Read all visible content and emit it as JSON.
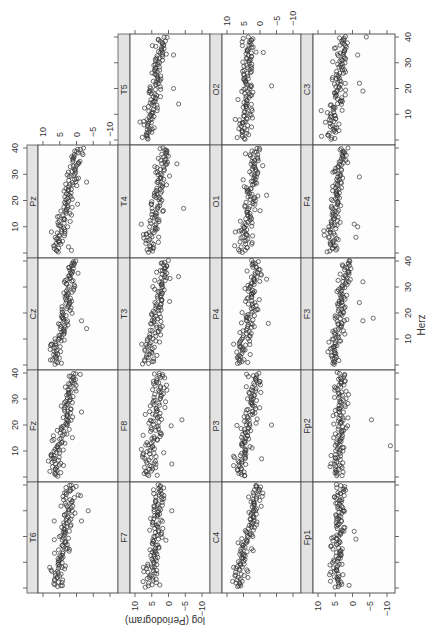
{
  "chart_data": {
    "type": "scatter",
    "title": "",
    "xlabel": "Herz",
    "ylabel": "log (Periodogram)",
    "xlim": [
      0,
      40
    ],
    "ylim": [
      -10,
      10
    ],
    "x_ticks": [
      10,
      20,
      30,
      40
    ],
    "y_ticks": [
      10,
      5,
      0,
      -5,
      -10
    ],
    "y_tick_labels": [
      "10",
      "5",
      "0",
      "−5",
      "−10"
    ],
    "x_tick_labels": [
      "10",
      "20",
      "30",
      "40"
    ],
    "grid": false,
    "legend": null,
    "layout": "trellis multi-panel (lattice xyplot), figure rotated 90° clockwise",
    "panels": [
      {
        "name": "T5",
        "row": 0,
        "col": 1,
        "intercept": 6.5,
        "slope": -0.12,
        "spread": 1.3,
        "outliers": [
          [
            14,
            -3
          ],
          [
            20,
            -1.5
          ],
          [
            33,
            -1.5
          ],
          [
            7,
            8.5
          ]
        ]
      },
      {
        "name": "O2",
        "row": 0,
        "col": 2,
        "intercept": 4.5,
        "slope": -0.03,
        "spread": 1.3,
        "outliers": [
          [
            21,
            -3.5
          ],
          [
            34,
            -1
          ],
          [
            8,
            7.5
          ]
        ]
      },
      {
        "name": "C3",
        "row": 0,
        "col": 3,
        "intercept": 6.0,
        "slope": -0.08,
        "spread": 1.3,
        "outliers": [
          [
            19,
            -3
          ],
          [
            22,
            -2
          ],
          [
            40,
            -4
          ],
          [
            33,
            -1.5
          ]
        ]
      },
      {
        "name": "Pz",
        "row": 1,
        "col": 0,
        "intercept": 6.0,
        "slope": -0.17,
        "spread": 1.2,
        "outliers": [
          [
            27,
            -3
          ],
          [
            1,
            1.5
          ],
          [
            8,
            7.5
          ]
        ]
      },
      {
        "name": "T4",
        "row": 1,
        "col": 1,
        "intercept": 5.5,
        "slope": -0.12,
        "spread": 1.5,
        "outliers": [
          [
            17,
            -4.5
          ],
          [
            34,
            -2.5
          ],
          [
            7,
            7.5
          ]
        ]
      },
      {
        "name": "O1",
        "row": 1,
        "col": 2,
        "intercept": 5.0,
        "slope": -0.1,
        "spread": 1.5,
        "outliers": [
          [
            22,
            -2
          ],
          [
            8,
            7.5
          ]
        ]
      },
      {
        "name": "F4",
        "row": 1,
        "col": 3,
        "intercept": 6.0,
        "slope": -0.08,
        "spread": 1.1,
        "outliers": [
          [
            10,
            -1.5
          ],
          [
            6,
            -1
          ],
          [
            29,
            -2
          ],
          [
            11,
            -0.5
          ]
        ]
      },
      {
        "name": "Cz",
        "row": 2,
        "col": 0,
        "intercept": 6.5,
        "slope": -0.15,
        "spread": 1.3,
        "outliers": [
          [
            14,
            -3
          ],
          [
            17,
            -1.5
          ],
          [
            8,
            7.5
          ]
        ]
      },
      {
        "name": "T3",
        "row": 2,
        "col": 1,
        "intercept": 6.0,
        "slope": -0.13,
        "spread": 1.4,
        "outliers": [
          [
            34,
            -3
          ],
          [
            8,
            8
          ]
        ]
      },
      {
        "name": "P4",
        "row": 2,
        "col": 2,
        "intercept": 5.5,
        "slope": -0.11,
        "spread": 1.4,
        "outliers": [
          [
            16,
            -2.5
          ],
          [
            33,
            -2
          ],
          [
            8,
            8
          ]
        ]
      },
      {
        "name": "F3",
        "row": 2,
        "col": 3,
        "intercept": 5.5,
        "slope": -0.1,
        "spread": 1.1,
        "outliers": [
          [
            18,
            -6
          ],
          [
            17,
            -3
          ],
          [
            32,
            -3
          ],
          [
            24,
            -2
          ]
        ]
      },
      {
        "name": "Fz",
        "row": 3,
        "col": 0,
        "intercept": 6.5,
        "slope": -0.14,
        "spread": 1.3,
        "outliers": [
          [
            8,
            7.5
          ],
          [
            25,
            -1.5
          ]
        ]
      },
      {
        "name": "F8",
        "row": 3,
        "col": 1,
        "intercept": 6.0,
        "slope": -0.1,
        "spread": 1.6,
        "outliers": [
          [
            22,
            -4
          ],
          [
            9,
            7.5
          ],
          [
            5,
            -1
          ]
        ]
      },
      {
        "name": "P3",
        "row": 3,
        "col": 2,
        "intercept": 6.0,
        "slope": -0.12,
        "spread": 1.3,
        "outliers": [
          [
            20,
            -3.5
          ],
          [
            7,
            -0.5
          ],
          [
            8,
            8
          ]
        ]
      },
      {
        "name": "Fp2",
        "row": 3,
        "col": 3,
        "intercept": 4.0,
        "slope": -0.01,
        "spread": 1.2,
        "outliers": [
          [
            22,
            -5.5
          ],
          [
            12,
            -11
          ],
          [
            4,
            6.5
          ]
        ]
      },
      {
        "name": "T6",
        "row": 4,
        "col": 0,
        "intercept": 6.0,
        "slope": -0.11,
        "spread": 1.3,
        "outliers": [
          [
            26,
            -1.5
          ],
          [
            30,
            -3.5
          ],
          [
            8,
            8
          ]
        ]
      },
      {
        "name": "F7",
        "row": 4,
        "col": 1,
        "intercept": 5.0,
        "slope": -0.06,
        "spread": 1.3,
        "outliers": [
          [
            30,
            -1
          ],
          [
            8,
            7.5
          ]
        ]
      },
      {
        "name": "C4",
        "row": 4,
        "col": 2,
        "intercept": 6.5,
        "slope": -0.15,
        "spread": 1.2,
        "outliers": [
          [
            8,
            8
          ]
        ]
      },
      {
        "name": "Fp1",
        "row": 4,
        "col": 3,
        "intercept": 4.5,
        "slope": -0.02,
        "spread": 1.2,
        "outliers": [
          [
            22,
            -0.5
          ],
          [
            19,
            -1
          ],
          [
            1,
            1
          ]
        ]
      }
    ]
  },
  "labels": {
    "x_axis_title": "Herz",
    "y_axis_title": "log (Periodogram)"
  }
}
